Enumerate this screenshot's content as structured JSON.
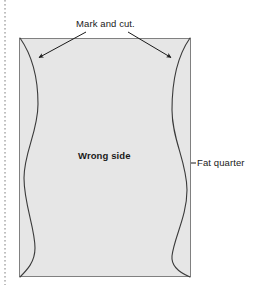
{
  "diagram": {
    "labels": {
      "mark_and_cut": "Mark and cut.",
      "wrong_side": "Wrong side",
      "fat_quarter": "Fat quarter"
    },
    "colors": {
      "fabric_fill": "#e6e6e6",
      "fabric_stroke": "#808080",
      "line": "#1a1a1a",
      "background": "#ffffff",
      "margin_rule": "#808080"
    },
    "shapes": {
      "fabric_rect": {
        "x": 19,
        "y": 38,
        "width": 172,
        "height": 239
      },
      "left_wave": "starts top-left corner, bulges right, curves back left, bulges right, ends bottom-left corner",
      "right_wave": "starts top-right corner, bulges left, curves back right, bulges left, ends bottom-right corner",
      "margin_dotted_line": {
        "x": 5,
        "y_start": 0,
        "y_end": 285
      }
    },
    "annotations": [
      {
        "name": "arrow-left",
        "from_x": 86,
        "from_y": 32,
        "to_x": 38,
        "to_y": 58,
        "points_to": "left_wave"
      },
      {
        "name": "arrow-right",
        "from_x": 128,
        "from_y": 32,
        "to_x": 172,
        "to_y": 58,
        "points_to": "right_wave"
      },
      {
        "name": "leader-fat-quarter",
        "from_x": 191,
        "from_y": 163,
        "to_x": 196,
        "to_y": 163,
        "points_to": "fabric_rect"
      }
    ]
  }
}
